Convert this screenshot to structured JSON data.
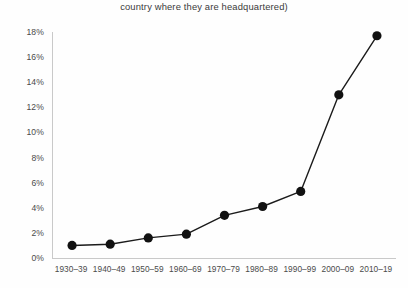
{
  "chart_data": {
    "type": "line",
    "title": "country where they are headquartered)",
    "xlabel": "",
    "ylabel": "",
    "categories": [
      "1930–39",
      "1940–49",
      "1950–59",
      "1960–69",
      "1970–79",
      "1980–89",
      "1990–99",
      "2000–09",
      "2010–19"
    ],
    "values": [
      1.0,
      1.1,
      1.6,
      1.9,
      3.4,
      4.1,
      5.3,
      13.0,
      17.7
    ],
    "ylim": [
      0,
      18
    ],
    "ytick_values": [
      0,
      2,
      4,
      6,
      8,
      10,
      12,
      14,
      16,
      18
    ],
    "ytick_labels": [
      "0%",
      "2%",
      "4%",
      "6%",
      "8%",
      "10%",
      "12%",
      "14%",
      "16%",
      "18%"
    ],
    "grid": false,
    "legend": false,
    "marker": "circle",
    "marker_color": "#111111",
    "line_color": "#1b1b1b",
    "axis_color": "#c9c9c9",
    "background": "#ffffff"
  }
}
